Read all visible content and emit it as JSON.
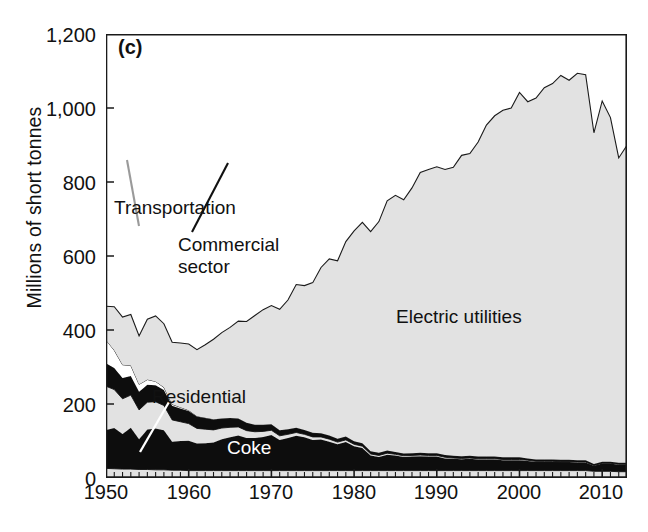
{
  "figure": {
    "panel_label": "(c)",
    "ylabel": "Millions of short tonnes"
  },
  "axes": {
    "y_ticks": [
      "1,200",
      "1,000",
      "800",
      "600",
      "400",
      "200",
      "0"
    ],
    "x_ticks": [
      "1950",
      "1960",
      "1970",
      "1980",
      "1990",
      "2000",
      "2010"
    ]
  },
  "annotations": {
    "transportation": "Transportation",
    "commercial_line1": "Commercial",
    "commercial_line2": "sector",
    "residential": "Residential",
    "coke": "Coke",
    "electric_utilities": "Electric utilities"
  },
  "colors": {
    "area_gray": "#e2e2e2",
    "area_black": "#0d0d0d",
    "area_white": "#ffffff",
    "axis": "#1a1a1a",
    "text": "#111111"
  },
  "chart_data": {
    "type": "area",
    "title": "",
    "subtitle": "",
    "xlabel": "",
    "ylabel": "Millions of short tonnes",
    "xlim": [
      1950,
      2013
    ],
    "ylim": [
      0,
      1200
    ],
    "grid": false,
    "legend": "inline-annotations",
    "stacked": true,
    "stack_order_bottom_to_top": [
      "Other",
      "Coke",
      "Residential",
      "Commercial sector",
      "Transportation",
      "Electric utilities"
    ],
    "series_fill": {
      "Other": "#e2e2e2",
      "Coke": "#0d0d0d",
      "Residential": "#e2e2e2",
      "Commercial sector": "#0d0d0d",
      "Transportation": "#ffffff",
      "Electric utilities": "#e2e2e2"
    },
    "x": [
      1950,
      1951,
      1952,
      1953,
      1954,
      1955,
      1956,
      1957,
      1958,
      1959,
      1960,
      1961,
      1962,
      1963,
      1964,
      1965,
      1966,
      1967,
      1968,
      1969,
      1970,
      1971,
      1972,
      1973,
      1974,
      1975,
      1976,
      1977,
      1978,
      1979,
      1980,
      1981,
      1982,
      1983,
      1984,
      1985,
      1986,
      1987,
      1988,
      1989,
      1990,
      1991,
      1992,
      1993,
      1994,
      1995,
      1996,
      1997,
      1998,
      1999,
      2000,
      2001,
      2002,
      2003,
      2004,
      2005,
      2006,
      2007,
      2008,
      2009,
      2010,
      2011,
      2012,
      2013
    ],
    "series": [
      {
        "name": "Other",
        "values": [
          26,
          25,
          24,
          24,
          23,
          23,
          22,
          22,
          21,
          21,
          20,
          20,
          20,
          20,
          20,
          20,
          20,
          20,
          20,
          20,
          20,
          20,
          20,
          20,
          20,
          20,
          20,
          20,
          20,
          20,
          20,
          20,
          20,
          20,
          20,
          20,
          20,
          20,
          20,
          20,
          20,
          20,
          20,
          20,
          20,
          20,
          20,
          20,
          20,
          20,
          20,
          20,
          20,
          20,
          20,
          20,
          20,
          20,
          20,
          18,
          18,
          18,
          17,
          17
        ]
      },
      {
        "name": "Coke",
        "values": [
          104,
          110,
          95,
          112,
          82,
          108,
          112,
          107,
          77,
          79,
          81,
          73,
          74,
          76,
          85,
          90,
          95,
          88,
          88,
          91,
          96,
          83,
          88,
          94,
          90,
          83,
          84,
          78,
          71,
          77,
          66,
          61,
          41,
          37,
          43,
          41,
          37,
          38,
          39,
          38,
          38,
          33,
          32,
          31,
          32,
          30,
          30,
          30,
          28,
          28,
          28,
          26,
          24,
          24,
          24,
          23,
          23,
          22,
          22,
          15,
          21,
          21,
          19,
          19
        ]
      },
      {
        "name": "Residential",
        "values": [
          118,
          104,
          95,
          88,
          79,
          74,
          72,
          67,
          59,
          52,
          46,
          41,
          38,
          34,
          30,
          27,
          23,
          20,
          17,
          15,
          13,
          11,
          10,
          9,
          8,
          8,
          7,
          7,
          6,
          6,
          5,
          5,
          4,
          4,
          4,
          3,
          3,
          3,
          3,
          3,
          3,
          3,
          2,
          2,
          2,
          2,
          2,
          2,
          2,
          2,
          2,
          2,
          1,
          1,
          1,
          1,
          1,
          1,
          1,
          1,
          1,
          1,
          1,
          1
        ]
      },
      {
        "name": "Commercial sector",
        "values": [
          62,
          58,
          56,
          52,
          49,
          47,
          45,
          42,
          38,
          36,
          34,
          32,
          30,
          28,
          26,
          25,
          23,
          21,
          19,
          18,
          16,
          15,
          14,
          13,
          12,
          11,
          10,
          10,
          9,
          9,
          8,
          8,
          7,
          7,
          7,
          6,
          6,
          6,
          6,
          6,
          6,
          6,
          6,
          6,
          6,
          6,
          6,
          6,
          6,
          6,
          6,
          5,
          5,
          5,
          5,
          5,
          5,
          5,
          5,
          4,
          4,
          4,
          4,
          4
        ]
      },
      {
        "name": "Transportation",
        "values": [
          63,
          48,
          36,
          28,
          20,
          14,
          10,
          7,
          4,
          3,
          2,
          1,
          1,
          1,
          0,
          0,
          0,
          0,
          0,
          0,
          0,
          0,
          0,
          0,
          0,
          0,
          0,
          0,
          0,
          0,
          0,
          0,
          0,
          0,
          0,
          0,
          0,
          0,
          0,
          0,
          0,
          0,
          0,
          0,
          0,
          0,
          0,
          0,
          0,
          0,
          0,
          0,
          0,
          0,
          0,
          0,
          0,
          0,
          0,
          0,
          0,
          0,
          0,
          0
        ]
      },
      {
        "name": "Electric utilities",
        "values": [
          91,
          118,
          129,
          138,
          131,
          163,
          177,
          172,
          168,
          174,
          179,
          180,
          197,
          216,
          232,
          245,
          263,
          274,
          295,
          311,
          321,
          327,
          349,
          387,
          390,
          406,
          448,
          477,
          481,
          527,
          569,
          597,
          594,
          625,
          675,
          694,
          686,
          717,
          758,
          767,
          774,
          772,
          780,
          813,
          817,
          850,
          896,
          921,
          938,
          944,
          986,
          964,
          977,
          1005,
          1016,
          1039,
          1026,
          1046,
          1042,
          895,
          975,
          930,
          824,
          858
        ]
      }
    ],
    "notes": {
      "total_1950": 464,
      "total_peak_year": 2007,
      "total_peak": 1074,
      "total_2013": 899
    }
  }
}
